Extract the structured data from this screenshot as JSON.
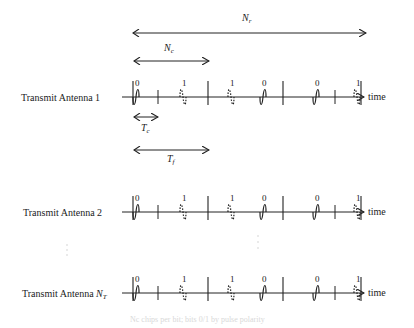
{
  "diagram": {
    "annotations": {
      "Nr": {
        "base": "N",
        "sub": "r"
      },
      "Nc": {
        "base": "N",
        "sub": "c"
      },
      "Tc": {
        "base": "T",
        "sub": "c"
      },
      "Tf": {
        "base": "T",
        "sub": "f"
      }
    },
    "axis_label": "time",
    "antennas": [
      {
        "label": "Transmit Antenna 1",
        "label_sub": ""
      },
      {
        "label": "Transmit Antenna 2",
        "label_sub": ""
      },
      {
        "label": "Transmit Antenna ",
        "label_italic": "N",
        "label_sub": "T"
      }
    ],
    "bits": [
      "0",
      "1",
      "1",
      "0",
      "0",
      "1"
    ],
    "ellipsis": "⋮",
    "footer_faint": "Nc chips per bit; bits 0/1 by pulse polarity"
  }
}
